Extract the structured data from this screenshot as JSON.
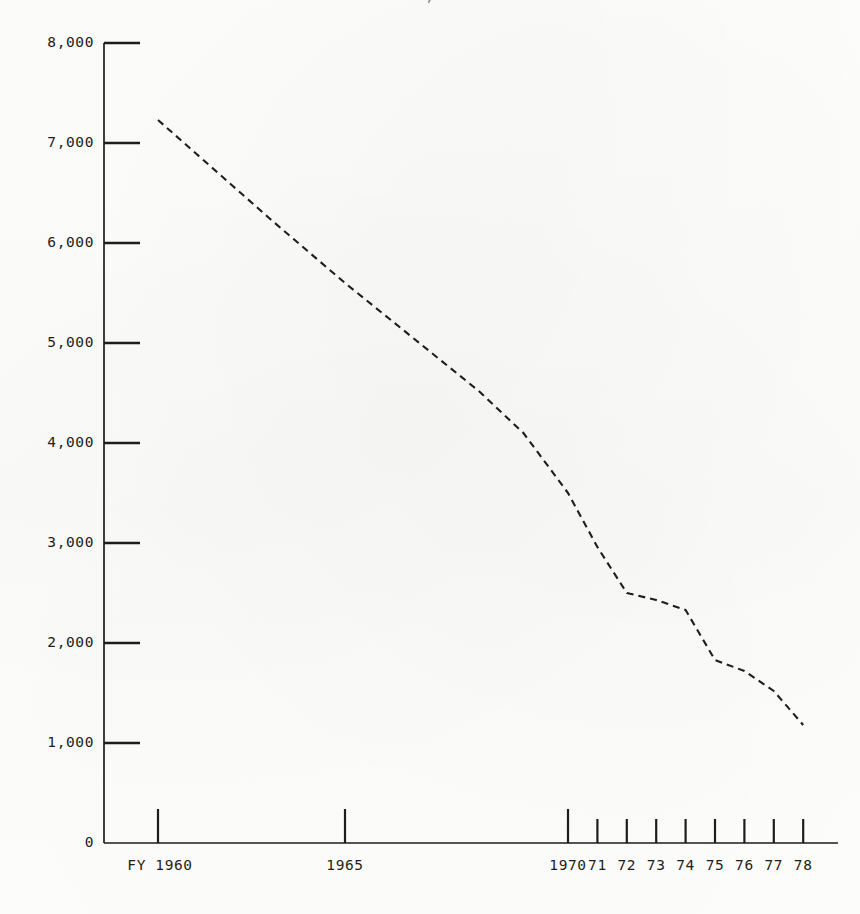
{
  "figure": {
    "title_fragment_cut_off": ", ",
    "background_color": "#fdfdfb",
    "ink_color": "#1d1d1d"
  },
  "chart_data": {
    "type": "line",
    "title": "",
    "xlabel": "",
    "ylabel": "",
    "grid": false,
    "legend": "none",
    "line_style": "dashed",
    "line_color": "#1d1d1d",
    "ylim": [
      0,
      8000
    ],
    "y_ticks": [
      0,
      1000,
      2000,
      3000,
      4000,
      5000,
      6000,
      7000,
      8000
    ],
    "y_tick_labels": [
      "0",
      "1,000",
      "2,000",
      "3,000",
      "4,000",
      "5,000",
      "6,000",
      "7,000",
      "8,000"
    ],
    "x_tick_labels": [
      "FY 1960",
      "1965",
      "1970",
      "71",
      "72",
      "73",
      "74",
      "75",
      "76",
      "77",
      "78"
    ],
    "x_tick_years": [
      1960,
      1965,
      1970,
      1971,
      1972,
      1973,
      1974,
      1975,
      1976,
      1977,
      1978
    ],
    "x": [
      1960,
      1961,
      1962,
      1963,
      1964,
      1965,
      1966,
      1967,
      1968,
      1969,
      1970,
      1971,
      1972,
      1973,
      1974,
      1975,
      1976,
      1977,
      1978
    ],
    "values": [
      7230,
      6900,
      6570,
      6240,
      5920,
      5600,
      5240,
      4880,
      4520,
      4100,
      3500,
      2960,
      2500,
      2430,
      2330,
      1830,
      1720,
      1520,
      1180
    ],
    "series": [
      {
        "name": "series-1",
        "values": [
          7230,
          6900,
          6570,
          6240,
          5920,
          5600,
          5240,
          4880,
          4520,
          4100,
          3500,
          2960,
          2500,
          2430,
          2330,
          1830,
          1720,
          1520,
          1180
        ]
      }
    ]
  },
  "axes": {
    "y_axis_name": "y-axis",
    "x_axis_name": "x-axis"
  }
}
